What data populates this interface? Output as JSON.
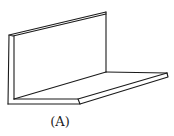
{
  "figure": {
    "caption": "(A)",
    "stroke_color": "#1a1a1a",
    "background": "#ffffff"
  }
}
